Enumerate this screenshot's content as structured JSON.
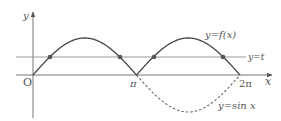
{
  "diagram": {
    "axis_labels": {
      "x": "x",
      "y": "y",
      "origin": "O"
    },
    "tick_labels": {
      "pi": "π",
      "two_pi": "2π"
    },
    "curve_labels": {
      "f": "y=f(x)",
      "t": "y=t",
      "sin": "y=sin x"
    },
    "colors": {
      "axis": "#666666",
      "curve": "#444444",
      "line_t": "#888888",
      "dashed": "#666666",
      "dot": "#444444"
    }
  }
}
